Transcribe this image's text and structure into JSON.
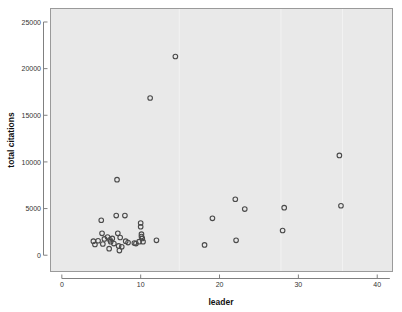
{
  "chart_data": {
    "type": "scatter",
    "title": "",
    "xlabel": "leader",
    "ylabel": "total citations",
    "xlim": [
      -1.5,
      42
    ],
    "ylim": [
      -1800,
      26500
    ],
    "xticks": [
      0,
      10,
      20,
      30,
      40
    ],
    "xtick_labels": [
      "0",
      "10",
      "20",
      "30",
      "40"
    ],
    "yticks": [
      0,
      5000,
      10000,
      15000,
      20000,
      25000
    ],
    "ytick_labels": [
      "0",
      "5000",
      "10000",
      "15000",
      "20000",
      "25000"
    ],
    "grid": false,
    "legend": false,
    "marker": "open-circle",
    "marker_color": "#4a4a4a",
    "plot_background": "#e9e9e9",
    "points": [
      {
        "x": 4.0,
        "y": 1500
      },
      {
        "x": 4.2,
        "y": 1150
      },
      {
        "x": 4.6,
        "y": 1550
      },
      {
        "x": 5.0,
        "y": 3750
      },
      {
        "x": 5.1,
        "y": 2350
      },
      {
        "x": 5.2,
        "y": 1200
      },
      {
        "x": 5.4,
        "y": 1750
      },
      {
        "x": 5.8,
        "y": 1950
      },
      {
        "x": 6.0,
        "y": 700
      },
      {
        "x": 6.1,
        "y": 1650
      },
      {
        "x": 6.2,
        "y": 1450
      },
      {
        "x": 6.4,
        "y": 1800
      },
      {
        "x": 6.6,
        "y": 1250
      },
      {
        "x": 6.9,
        "y": 4250
      },
      {
        "x": 7.0,
        "y": 8100
      },
      {
        "x": 7.1,
        "y": 2350
      },
      {
        "x": 7.2,
        "y": 1000
      },
      {
        "x": 7.3,
        "y": 500
      },
      {
        "x": 7.4,
        "y": 1900
      },
      {
        "x": 7.6,
        "y": 900
      },
      {
        "x": 8.0,
        "y": 4250
      },
      {
        "x": 8.1,
        "y": 1500
      },
      {
        "x": 8.4,
        "y": 1350
      },
      {
        "x": 9.2,
        "y": 1300
      },
      {
        "x": 9.4,
        "y": 1250
      },
      {
        "x": 9.8,
        "y": 1450
      },
      {
        "x": 10.0,
        "y": 3450
      },
      {
        "x": 10.0,
        "y": 3050
      },
      {
        "x": 10.1,
        "y": 2250
      },
      {
        "x": 10.1,
        "y": 2000
      },
      {
        "x": 10.2,
        "y": 1800
      },
      {
        "x": 10.3,
        "y": 1450
      },
      {
        "x": 11.2,
        "y": 16850
      },
      {
        "x": 12.0,
        "y": 1600
      },
      {
        "x": 14.4,
        "y": 21300
      },
      {
        "x": 18.1,
        "y": 1100
      },
      {
        "x": 19.1,
        "y": 3950
      },
      {
        "x": 22.0,
        "y": 6000
      },
      {
        "x": 22.1,
        "y": 1600
      },
      {
        "x": 23.2,
        "y": 4950
      },
      {
        "x": 28.0,
        "y": 2650
      },
      {
        "x": 28.2,
        "y": 5100
      },
      {
        "x": 35.2,
        "y": 10700
      },
      {
        "x": 35.4,
        "y": 5300
      }
    ]
  },
  "axes": {
    "x_title": "leader",
    "y_title": "total citations"
  }
}
